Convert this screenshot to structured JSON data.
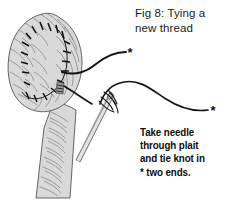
{
  "figure": {
    "title_lines": [
      "Fig 8: Tying a",
      "new thread"
    ],
    "title_full": "Fig 8: Tying a new thread",
    "caption_lines": [
      "Take needle",
      "through plait",
      "and tie knot in",
      "* two ends."
    ],
    "caption_full": "Take needle through plait and tie knot in * two ends.",
    "background_color": "#ffffff",
    "ink_color": "#1a1a1a",
    "plait_fill_color": "#d9d9d9",
    "plait_outline_color": "#555555",
    "hair_stroke_color": "#6e6e6e",
    "stitch_color": "#111111",
    "thread_color": "#141414",
    "needle_color": "#8c8c8c",
    "parts": {
      "plait_label": "plaited horse tail",
      "stitch_label": "running stitch seam",
      "needle_label": "sewing needle",
      "thread_upper_label": "upper thread end",
      "thread_lower_label": "lower thread end",
      "knot_label": "knot at needle eye",
      "asterisk_marker": "*",
      "asterisk_count": 2
    }
  }
}
